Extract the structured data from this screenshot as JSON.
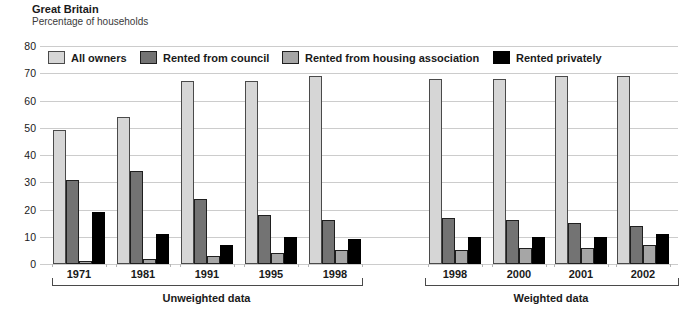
{
  "header": {
    "title": "Great Britain",
    "subtitle": "Percentage of households"
  },
  "chart_data": {
    "type": "bar",
    "title": "Great Britain",
    "ylabel": "Percentage of households",
    "xlabel": "",
    "ylim": [
      0,
      80
    ],
    "yticks": [
      0,
      10,
      20,
      30,
      40,
      50,
      60,
      70,
      80
    ],
    "grid": true,
    "legend_position": "top",
    "legend": [
      {
        "label": "All owners",
        "fill": "#d6d6d6",
        "border": "#4a4a4a"
      },
      {
        "label": "Rented from council",
        "fill": "#737373",
        "border": "#1f1f1f"
      },
      {
        "label": "Rented from housing association",
        "fill": "#a6a6a6",
        "border": "#1f1f1f"
      },
      {
        "label": "Rented privately",
        "fill": "#000000",
        "border": "#000000"
      }
    ],
    "sections": [
      {
        "label": "Unweighted data",
        "categories": [
          "1971",
          "1981",
          "1991",
          "1995",
          "1998"
        ],
        "series": [
          {
            "name": "All owners",
            "values": [
              49,
              54,
              67,
              67,
              69
            ]
          },
          {
            "name": "Rented from council",
            "values": [
              31,
              34,
              24,
              18,
              16
            ]
          },
          {
            "name": "Rented from housing association",
            "values": [
              1,
              2,
              3,
              4,
              5
            ]
          },
          {
            "name": "Rented privately",
            "values": [
              19,
              11,
              7,
              10,
              9
            ]
          }
        ]
      },
      {
        "label": "Weighted data",
        "categories": [
          "1998",
          "2000",
          "2001",
          "2002"
        ],
        "series": [
          {
            "name": "All owners",
            "values": [
              68,
              68,
              69,
              69
            ]
          },
          {
            "name": "Rented from council",
            "values": [
              17,
              16,
              15,
              14
            ]
          },
          {
            "name": "Rented from housing association",
            "values": [
              5,
              6,
              6,
              7
            ]
          },
          {
            "name": "Rented privately",
            "values": [
              10,
              10,
              10,
              11
            ]
          }
        ]
      }
    ]
  }
}
